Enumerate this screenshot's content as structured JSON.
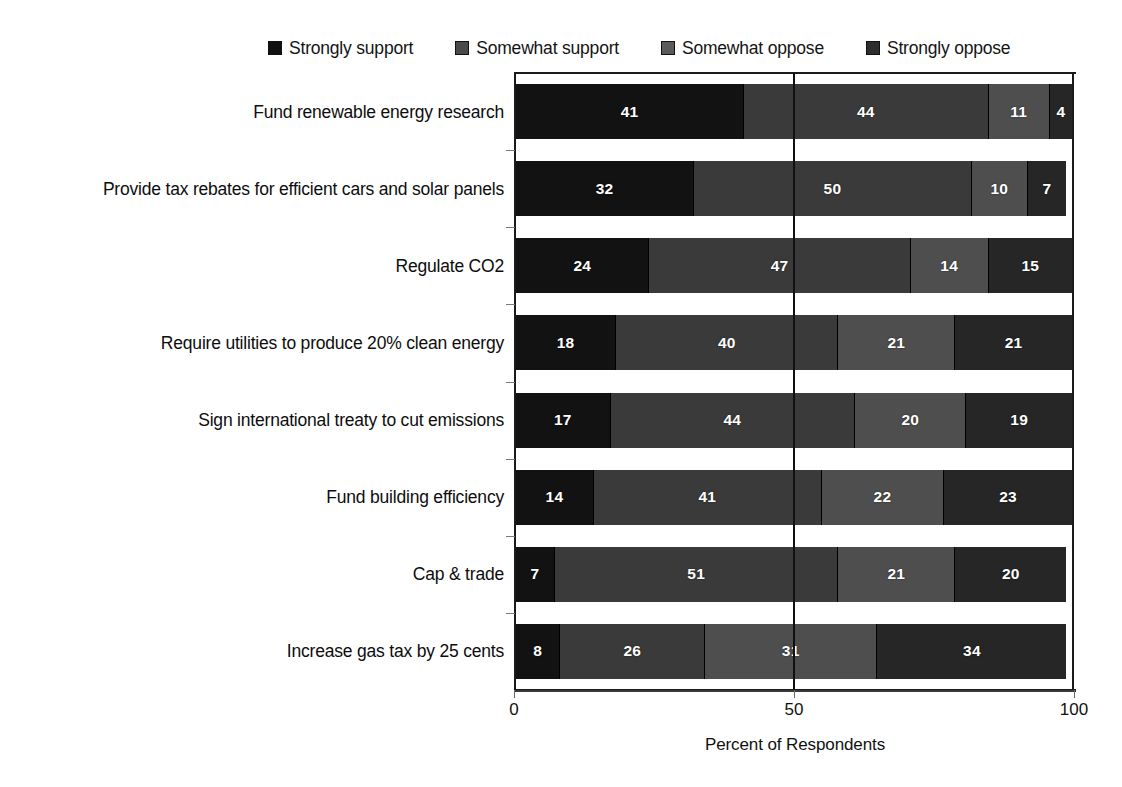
{
  "chart_data": {
    "type": "bar",
    "orientation": "horizontal",
    "stacked": true,
    "stacked_mode": "percent",
    "title": "",
    "xlabel": "Percent of Respondents",
    "ylabel": "",
    "xlim": [
      0,
      100
    ],
    "xticks": [
      0,
      50,
      100
    ],
    "xtick_labels": [
      "0",
      "50",
      "100"
    ],
    "grid": false,
    "gridlines_x": [
      50
    ],
    "legend_position": "top",
    "categories": [
      "Fund renewable energy research",
      "Provide tax rebates for efficient cars and solar panels",
      "Regulate CO2",
      "Require utilities to produce 20% clean energy",
      "Sign international treaty to cut emissions",
      "Fund building efficiency",
      "Cap & trade",
      "Increase gas tax by 25 cents"
    ],
    "series": [
      {
        "name": "Strongly support",
        "color": "#121212",
        "values": [
          41,
          32,
          24,
          18,
          17,
          14,
          7,
          8
        ]
      },
      {
        "name": "Somewhat support",
        "color": "#3a3a3a",
        "values": [
          44,
          50,
          47,
          40,
          44,
          41,
          51,
          26
        ]
      },
      {
        "name": "Somewhat oppose",
        "color": "#4e4e4e",
        "values": [
          11,
          10,
          14,
          21,
          20,
          22,
          21,
          31
        ]
      },
      {
        "name": "Strongly oppose",
        "color": "#262626",
        "values": [
          4,
          7,
          15,
          21,
          19,
          23,
          20,
          34
        ]
      }
    ]
  },
  "legend": {
    "items": [
      {
        "label": "Strongly support",
        "swatch_color": "#121212"
      },
      {
        "label": "Somewhat support",
        "swatch_color": "#4a4a4a"
      },
      {
        "label": "Somewhat oppose",
        "swatch_color": "#5a5a5a"
      },
      {
        "label": "Strongly oppose",
        "swatch_color": "#2e2e2e"
      }
    ]
  },
  "axis": {
    "x_title": "Percent of Respondents",
    "x_tick_labels": [
      "0",
      "50",
      "100"
    ]
  }
}
